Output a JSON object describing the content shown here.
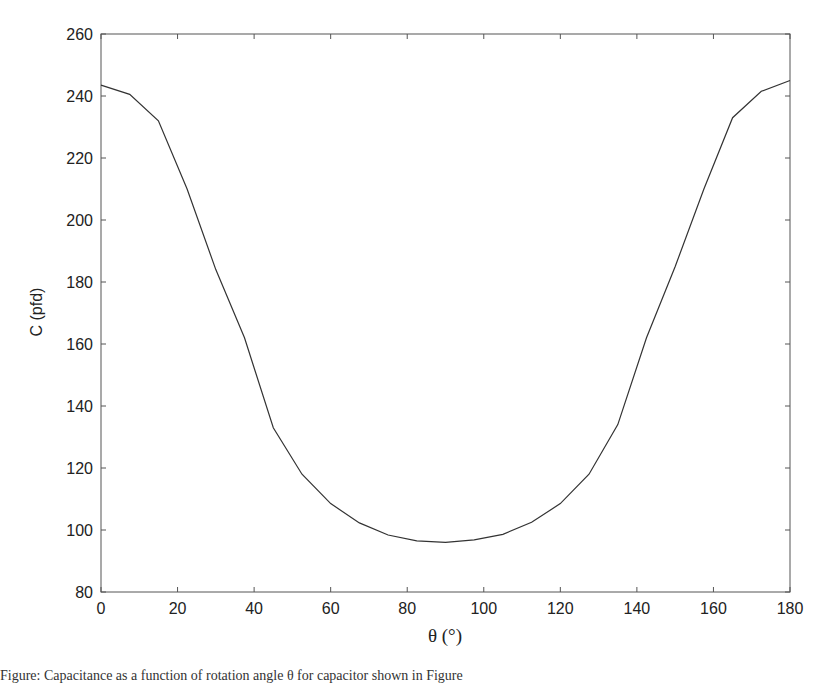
{
  "chart_data": {
    "type": "line",
    "title": "",
    "xlabel": "θ (°)",
    "ylabel": "C (pfd)",
    "xlim": [
      0,
      180
    ],
    "ylim": [
      80,
      260
    ],
    "xticks": [
      0,
      20,
      40,
      60,
      80,
      100,
      120,
      140,
      160,
      180
    ],
    "yticks": [
      80,
      100,
      120,
      140,
      160,
      180,
      200,
      220,
      240,
      260
    ],
    "grid": false,
    "legend": null,
    "series": [
      {
        "name": "C",
        "color": "#333333",
        "x": [
          0,
          7.5,
          15,
          22.5,
          30,
          37.5,
          45,
          52.5,
          60,
          67.5,
          75,
          82.5,
          90,
          97.5,
          105,
          112.5,
          120,
          127.5,
          135,
          142.5,
          150,
          157.5,
          165,
          172.5,
          180
        ],
        "y": [
          243.5,
          240.5,
          232,
          210,
          184,
          162,
          133,
          118,
          108.5,
          102.3,
          98.4,
          96.5,
          96,
          96.8,
          98.6,
          102.5,
          108.5,
          118,
          134,
          162,
          185,
          210,
          233,
          241.5,
          245
        ]
      }
    ]
  },
  "caption": {
    "text": "Figure: Capacitance as a function of rotation angle θ for capacitor shown in Figure"
  }
}
